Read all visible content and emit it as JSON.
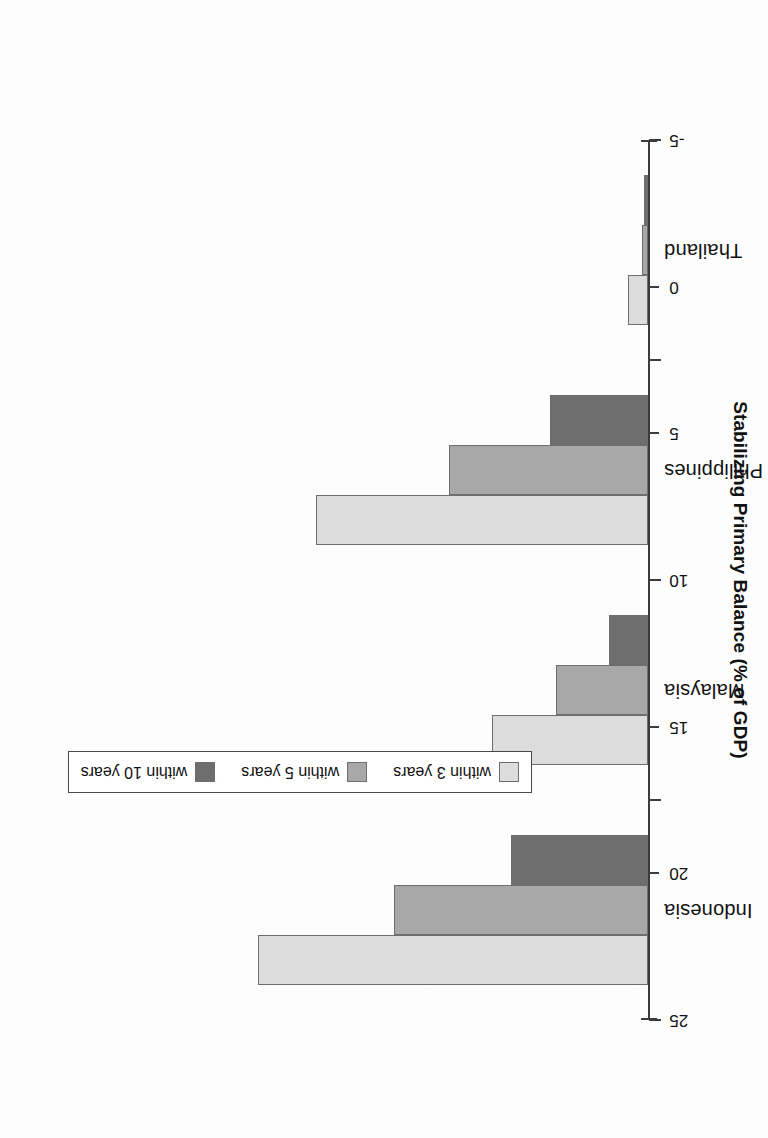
{
  "chart_data": {
    "type": "bar",
    "orientation": "vertical",
    "page_rotation_degrees": 180,
    "title": "",
    "subtitle": "",
    "xlabel": "",
    "ylabel": "Stabilizing Primary Balance (% of GDP)",
    "categories": [
      "Indonesia",
      "Malaysia",
      "Philippines",
      "Thailand"
    ],
    "series": [
      {
        "name": "within 3 years",
        "color": "#dcdcdc",
        "values": [
          20.0,
          8.0,
          17.0,
          1.0
        ]
      },
      {
        "name": "within 5 years",
        "color": "#a8a8a8",
        "values": [
          13.0,
          4.7,
          10.2,
          0.3
        ]
      },
      {
        "name": "within 10 years",
        "color": "#6e6e6e",
        "values": [
          7.0,
          2.0,
          5.0,
          0.2
        ]
      }
    ],
    "ylim": [
      -5,
      25
    ],
    "yticks": [
      25,
      20,
      15,
      10,
      5,
      0,
      -5
    ],
    "ytick_labels": [
      "25",
      "20",
      "15",
      "10",
      "5",
      "0",
      "-5"
    ],
    "grid": false,
    "legend_position": "center",
    "baseline_value": 0
  },
  "axis": {
    "title": "Stabilizing Primary Balance (% of GDP)",
    "ticks": [
      {
        "label": "25",
        "value": 25
      },
      {
        "label": "20",
        "value": 20
      },
      {
        "label": "15",
        "value": 15
      },
      {
        "label": "10",
        "value": 10
      },
      {
        "label": "5",
        "value": 5
      },
      {
        "label": "0",
        "value": 0
      },
      {
        "label": "-5",
        "value": -5
      }
    ]
  },
  "categories": [
    {
      "label": "Indonesia"
    },
    {
      "label": "Malaysia"
    },
    {
      "label": "Philippines"
    },
    {
      "label": "Thailand"
    }
  ],
  "legend": {
    "items": [
      {
        "label": "within 3 years",
        "color": "#dcdcdc"
      },
      {
        "label": "within 5 years",
        "color": "#a8a8a8"
      },
      {
        "label": "within 10 years",
        "color": "#6e6e6e"
      }
    ]
  }
}
